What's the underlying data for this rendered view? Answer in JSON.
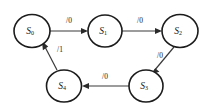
{
  "diagram": {
    "type": "finite-state-machine",
    "title": "",
    "background_color": "#ffffff",
    "node_stroke_color": "#1c1c1c",
    "edge_color": "#3a3a3a",
    "text_color": "#141414",
    "states": [
      {
        "id": "S0",
        "label": "S",
        "subscript": "0",
        "cx": 32,
        "cy": 31,
        "rx": 18,
        "ry": 16.5
      },
      {
        "id": "S1",
        "label": "S",
        "subscript": "1",
        "cx": 105,
        "cy": 31,
        "rx": 17,
        "ry": 16
      },
      {
        "id": "S2",
        "label": "S",
        "subscript": "2",
        "cx": 180,
        "cy": 31,
        "rx": 18,
        "ry": 16.5
      },
      {
        "id": "S3",
        "label": "S",
        "subscript": "3",
        "cx": 146,
        "cy": 86,
        "rx": 17,
        "ry": 16
      },
      {
        "id": "S4",
        "label": "S",
        "subscript": "4",
        "cx": 64,
        "cy": 86,
        "rx": 17.5,
        "ry": 16
      }
    ],
    "transitions": [
      {
        "id": "t0",
        "from": "S0",
        "to": "S1",
        "label": "/0",
        "label_x": 69,
        "label_y": 21
      },
      {
        "id": "t1",
        "from": "S1",
        "to": "S2",
        "label": "/0",
        "label_x": 140,
        "label_y": 21
      },
      {
        "id": "t2",
        "from": "S2",
        "to": "S3",
        "label": "/0",
        "label_x": 160,
        "label_y": 56
      },
      {
        "id": "t3",
        "from": "S3",
        "to": "S4",
        "label": "/0",
        "label_x": 105,
        "label_y": 77
      },
      {
        "id": "t4",
        "from": "S4",
        "to": "S0",
        "label": "/1",
        "label_x": 60,
        "label_y": 50
      }
    ]
  }
}
